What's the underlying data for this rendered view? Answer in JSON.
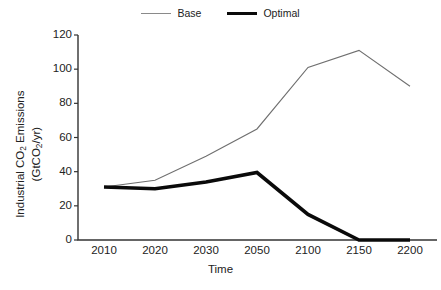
{
  "chart_data": {
    "type": "line",
    "title": "",
    "xlabel": "Time",
    "ylabel_line1": "Industrial CO2 Emissions",
    "ylabel_line2": "(GtCO2/yr)",
    "categories": [
      "2010",
      "2020",
      "2030",
      "2050",
      "2100",
      "2150",
      "2200"
    ],
    "ylim": [
      0,
      120
    ],
    "yticks": [
      "120",
      "100",
      "80",
      "60",
      "40",
      "20",
      "0"
    ],
    "ytick_values": [
      120,
      100,
      80,
      60,
      40,
      20,
      0
    ],
    "grid": false,
    "legend_position": "top-center",
    "series": [
      {
        "name": "Base",
        "values": [
          31,
          35,
          49,
          65,
          101,
          111,
          90
        ],
        "color": "#6f6f6f",
        "line_width": 1.1,
        "style": "thin"
      },
      {
        "name": "Optimal",
        "values": [
          31,
          30,
          34,
          39.5,
          15,
          0,
          0
        ],
        "color": "#0a0a0a",
        "line_width": 3.6,
        "style": "thick"
      }
    ]
  },
  "legend": {
    "entries": [
      {
        "label": "Base",
        "swatch": "thin-gray-line"
      },
      {
        "label": "Optimal",
        "swatch": "thick-black-line"
      }
    ]
  },
  "axes": {
    "axis_color": "#333333",
    "background": "#ffffff"
  }
}
